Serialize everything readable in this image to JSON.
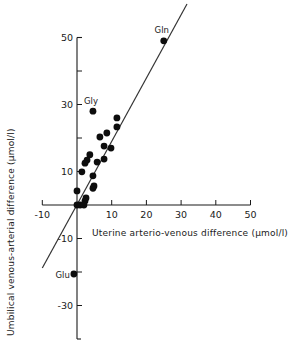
{
  "chart_data": {
    "type": "scatter",
    "title": "",
    "xlabel": "Uterine arterio-venous difference (μmol/l)",
    "ylabel": "Umbilical venous-arterial difference (μmol/l)",
    "xlim": [
      -10,
      50
    ],
    "ylim": [
      -40,
      50
    ],
    "x_ticks": [
      -10,
      0,
      10,
      20,
      30,
      40,
      50
    ],
    "x_tick_labels": [
      "-10",
      "",
      "10",
      "20",
      "30",
      "40",
      "50"
    ],
    "y_ticks": [
      50,
      40,
      30,
      20,
      10,
      -10,
      -20,
      -30
    ],
    "y_tick_labels": [
      {
        "value": 50,
        "label": "50"
      },
      {
        "value": 30,
        "label": "30"
      },
      {
        "value": 10,
        "label": "10"
      },
      {
        "value": -10,
        "label": "-10"
      },
      {
        "value": -30,
        "label": "-30"
      }
    ],
    "grid": false,
    "legend": "none",
    "series": [
      {
        "name": "amino acids",
        "points": [
          {
            "x": 25.0,
            "y": 49.0,
            "label": "Gln"
          },
          {
            "x": 4.6,
            "y": 28.0,
            "label": "Gly"
          },
          {
            "x": 11.5,
            "y": 26.0
          },
          {
            "x": 11.5,
            "y": 23.3
          },
          {
            "x": 8.6,
            "y": 21.5
          },
          {
            "x": 6.6,
            "y": 20.3
          },
          {
            "x": 7.8,
            "y": 17.6
          },
          {
            "x": 9.8,
            "y": 17.0
          },
          {
            "x": 3.7,
            "y": 15.0
          },
          {
            "x": 2.9,
            "y": 13.4
          },
          {
            "x": 2.3,
            "y": 12.5
          },
          {
            "x": 5.8,
            "y": 12.8
          },
          {
            "x": 7.8,
            "y": 13.7
          },
          {
            "x": 1.4,
            "y": 9.9
          },
          {
            "x": 4.6,
            "y": 8.7
          },
          {
            "x": 0.0,
            "y": 4.2
          },
          {
            "x": 4.6,
            "y": 5.0
          },
          {
            "x": 4.9,
            "y": 5.7
          },
          {
            "x": 2.6,
            "y": 2.1
          },
          {
            "x": 2.3,
            "y": 1.2
          },
          {
            "x": 0.0,
            "y": 0.0
          },
          {
            "x": 0.9,
            "y": 0.0
          },
          {
            "x": 2.0,
            "y": 0.0
          },
          {
            "x": -0.9,
            "y": -20.6,
            "label": "Glu"
          }
        ]
      }
    ],
    "regression_line": {
      "x1": -10,
      "y1": -18.8,
      "x2": 31.7,
      "y2": 60.0
    }
  }
}
